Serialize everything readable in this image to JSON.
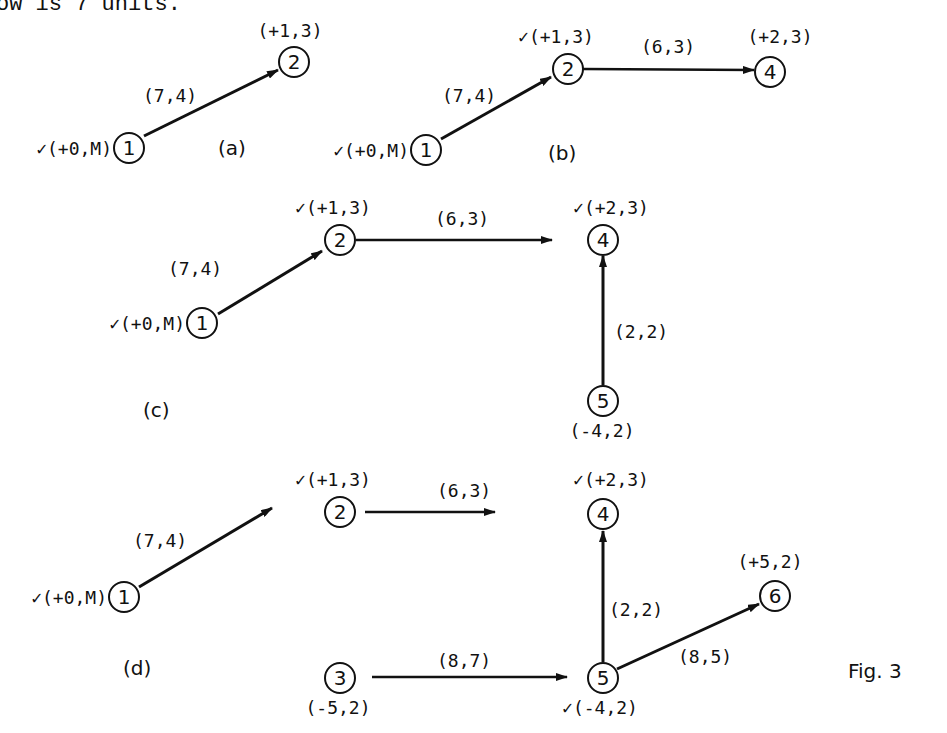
{
  "header_fragment": "ow is 7 units.",
  "figure_caption": "Fig. 3",
  "panels": {
    "a": {
      "label": "(a)",
      "nodes": {
        "n1": {
          "id": "1",
          "tag": "✓(+0,M)"
        },
        "n2": {
          "id": "2",
          "tag": "(+1,3)"
        }
      },
      "edges": {
        "e12": {
          "label": "(7,4)"
        }
      }
    },
    "b": {
      "label": "(b)",
      "nodes": {
        "n1": {
          "id": "1",
          "tag": "✓(+0,M)"
        },
        "n2": {
          "id": "2",
          "tag": "✓(+1,3)"
        },
        "n4": {
          "id": "4",
          "tag": "(+2,3)"
        }
      },
      "edges": {
        "e12": {
          "label": "(7,4)"
        },
        "e24": {
          "label": "(6,3)"
        }
      }
    },
    "c": {
      "label": "(c)",
      "nodes": {
        "n1": {
          "id": "1",
          "tag": "✓(+0,M)"
        },
        "n2": {
          "id": "2",
          "tag": "✓(+1,3)"
        },
        "n4": {
          "id": "4",
          "tag": "✓(+2,3)"
        },
        "n5": {
          "id": "5",
          "tag": "(-4,2)"
        }
      },
      "edges": {
        "e12": {
          "label": "(7,4)"
        },
        "e24": {
          "label": "(6,3)"
        },
        "e54": {
          "label": "(2,2)"
        }
      }
    },
    "d": {
      "label": "(d)",
      "nodes": {
        "n1": {
          "id": "1",
          "tag": "✓(+0,M)"
        },
        "n2": {
          "id": "2",
          "tag": "✓(+1,3)"
        },
        "n3": {
          "id": "3",
          "tag": "(-5,2)"
        },
        "n4": {
          "id": "4",
          "tag": "✓(+2,3)"
        },
        "n5": {
          "id": "5",
          "tag": "✓(-4,2)"
        },
        "n6": {
          "id": "6",
          "tag": "(+5,2)"
        }
      },
      "edges": {
        "e12": {
          "label": "(7,4)"
        },
        "e24": {
          "label": "(6,3)"
        },
        "e54": {
          "label": "(2,2)"
        },
        "e35": {
          "label": "(8,7)"
        },
        "e56": {
          "label": "(8,5)"
        }
      }
    }
  }
}
